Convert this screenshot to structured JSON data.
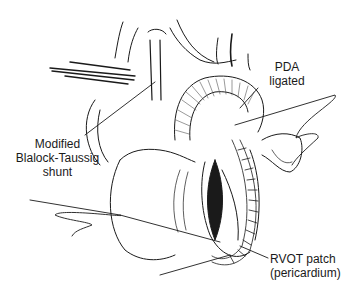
{
  "figure": {
    "type": "surgical-illustration",
    "colors": {
      "ink": "#1a1a1a",
      "background": "#ffffff",
      "hatch": "#555555"
    }
  },
  "labels": {
    "pda": {
      "line1": "PDA",
      "line2": "ligated"
    },
    "shunt": {
      "line1": "Modified",
      "line2": "Blalock-Taussig",
      "line3": "shunt"
    },
    "rvot": {
      "line1": "RVOT patch",
      "line2": "(pericardium)"
    }
  }
}
